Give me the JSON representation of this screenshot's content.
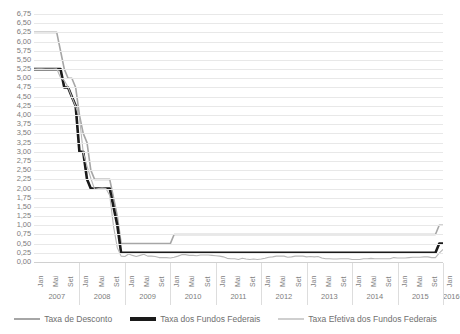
{
  "chart_data": {
    "type": "line",
    "title": "",
    "xlabel": "",
    "ylabel": "",
    "ylim": [
      0,
      6.75
    ],
    "ytick_step": 0.25,
    "grid": true,
    "legend_position": "bottom",
    "decimal_separator": ",",
    "y_ticks": [
      "6,75",
      "6,50",
      "6,25",
      "6,00",
      "5,75",
      "5,50",
      "5,25",
      "5,00",
      "4,75",
      "4,50",
      "4,25",
      "4,00",
      "3,75",
      "3,50",
      "3,25",
      "3,00",
      "2,75",
      "2,50",
      "2,25",
      "2,00",
      "1,75",
      "1,50",
      "1,25",
      "1,00",
      "0,75",
      "0,50",
      "0,25",
      "0,00"
    ],
    "years": [
      "2007",
      "2008",
      "2009",
      "2010",
      "2011",
      "2012",
      "2013",
      "2014",
      "2015",
      "2016"
    ],
    "month_ticks": [
      "Jan",
      "Mai",
      "Set",
      "Jan",
      "Mai",
      "Set",
      "Jan",
      "Mai",
      "Set",
      "Jan",
      "Mai",
      "Set",
      "Jan",
      "Mai",
      "Set",
      "Jan",
      "Mai",
      "Set",
      "Jan",
      "Mai",
      "Set",
      "Jan",
      "Mai",
      "Set",
      "Jan",
      "Mai",
      "Set",
      "Jan"
    ],
    "x_start": "Jan 2007",
    "x_end": "Jan 2016",
    "series": [
      {
        "name": "Taxa de Desconto",
        "color": "#a6a6a6",
        "width": 1.6,
        "values": [
          6.25,
          6.25,
          6.25,
          6.25,
          6.25,
          6.25,
          6.25,
          5.75,
          5.25,
          5.0,
          5.0,
          4.75,
          4.0,
          3.5,
          3.25,
          2.5,
          2.25,
          2.25,
          2.25,
          2.25,
          2.25,
          1.75,
          1.25,
          0.5,
          0.5,
          0.5,
          0.5,
          0.5,
          0.5,
          0.5,
          0.5,
          0.5,
          0.5,
          0.5,
          0.5,
          0.5,
          0.5,
          0.75,
          0.75,
          0.75,
          0.75,
          0.75,
          0.75,
          0.75,
          0.75,
          0.75,
          0.75,
          0.75,
          0.75,
          0.75,
          0.75,
          0.75,
          0.75,
          0.75,
          0.75,
          0.75,
          0.75,
          0.75,
          0.75,
          0.75,
          0.75,
          0.75,
          0.75,
          0.75,
          0.75,
          0.75,
          0.75,
          0.75,
          0.75,
          0.75,
          0.75,
          0.75,
          0.75,
          0.75,
          0.75,
          0.75,
          0.75,
          0.75,
          0.75,
          0.75,
          0.75,
          0.75,
          0.75,
          0.75,
          0.75,
          0.75,
          0.75,
          0.75,
          0.75,
          0.75,
          0.75,
          0.75,
          0.75,
          0.75,
          0.75,
          0.75,
          0.75,
          0.75,
          0.75,
          0.75,
          0.75,
          0.75,
          0.75,
          0.75,
          0.75,
          0.75,
          0.75,
          1.0,
          1.0
        ]
      },
      {
        "name": "Taxa dos Fundos Federais",
        "color": "#1a1a1a",
        "width": 2.6,
        "values": [
          5.25,
          5.25,
          5.25,
          5.25,
          5.25,
          5.25,
          5.25,
          5.25,
          4.75,
          4.75,
          4.5,
          4.25,
          3.0,
          3.0,
          2.25,
          2.0,
          2.0,
          2.0,
          2.0,
          2.0,
          2.0,
          1.5,
          1.0,
          0.25,
          0.25,
          0.25,
          0.25,
          0.25,
          0.25,
          0.25,
          0.25,
          0.25,
          0.25,
          0.25,
          0.25,
          0.25,
          0.25,
          0.25,
          0.25,
          0.25,
          0.25,
          0.25,
          0.25,
          0.25,
          0.25,
          0.25,
          0.25,
          0.25,
          0.25,
          0.25,
          0.25,
          0.25,
          0.25,
          0.25,
          0.25,
          0.25,
          0.25,
          0.25,
          0.25,
          0.25,
          0.25,
          0.25,
          0.25,
          0.25,
          0.25,
          0.25,
          0.25,
          0.25,
          0.25,
          0.25,
          0.25,
          0.25,
          0.25,
          0.25,
          0.25,
          0.25,
          0.25,
          0.25,
          0.25,
          0.25,
          0.25,
          0.25,
          0.25,
          0.25,
          0.25,
          0.25,
          0.25,
          0.25,
          0.25,
          0.25,
          0.25,
          0.25,
          0.25,
          0.25,
          0.25,
          0.25,
          0.25,
          0.25,
          0.25,
          0.25,
          0.25,
          0.25,
          0.25,
          0.25,
          0.25,
          0.25,
          0.25,
          0.5,
          0.5
        ]
      },
      {
        "name": "Taxa Efetiva dos Fundos Federais",
        "color": "#b8b8b8",
        "width": 1.1,
        "values": [
          5.25,
          5.26,
          5.26,
          5.25,
          5.25,
          5.25,
          5.26,
          5.02,
          4.94,
          4.76,
          4.49,
          4.24,
          3.94,
          2.98,
          2.61,
          2.28,
          1.98,
          2.0,
          2.01,
          2.0,
          1.81,
          0.97,
          0.39,
          0.16,
          0.15,
          0.22,
          0.18,
          0.15,
          0.18,
          0.21,
          0.16,
          0.16,
          0.15,
          0.12,
          0.12,
          0.12,
          0.11,
          0.13,
          0.16,
          0.2,
          0.2,
          0.18,
          0.18,
          0.17,
          0.19,
          0.19,
          0.19,
          0.18,
          0.17,
          0.16,
          0.14,
          0.1,
          0.09,
          0.09,
          0.07,
          0.1,
          0.08,
          0.07,
          0.08,
          0.07,
          0.08,
          0.1,
          0.13,
          0.14,
          0.16,
          0.16,
          0.16,
          0.13,
          0.14,
          0.16,
          0.16,
          0.16,
          0.14,
          0.15,
          0.14,
          0.15,
          0.11,
          0.09,
          0.09,
          0.08,
          0.08,
          0.09,
          0.09,
          0.09,
          0.07,
          0.07,
          0.07,
          0.09,
          0.09,
          0.1,
          0.09,
          0.09,
          0.09,
          0.09,
          0.09,
          0.12,
          0.11,
          0.11,
          0.11,
          0.12,
          0.13,
          0.13,
          0.13,
          0.14,
          0.14,
          0.12,
          0.12,
          0.24,
          0.34
        ]
      }
    ]
  },
  "legend": {
    "items": [
      {
        "label": "Taxa de Desconto"
      },
      {
        "label": "Taxa dos Fundos Federais"
      },
      {
        "label": "Taxa Efetiva dos Fundos Federais"
      }
    ]
  }
}
